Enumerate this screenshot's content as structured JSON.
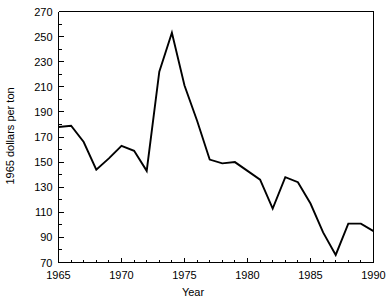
{
  "chart_data": {
    "type": "line",
    "title": "",
    "xlabel": "Year",
    "ylabel": "1965 dollars per ton",
    "xlim": [
      1965,
      1990
    ],
    "ylim": [
      70,
      270
    ],
    "grid": false,
    "legend": false,
    "x_major_ticks": [
      1965,
      1970,
      1975,
      1980,
      1985,
      1990
    ],
    "x_tick_labels": [
      "1965",
      "1970",
      "1975",
      "1980",
      "1985",
      "1990"
    ],
    "x_minor_tick_step": 1,
    "y_major_ticks": [
      70,
      90,
      110,
      130,
      150,
      170,
      190,
      210,
      230,
      250,
      270
    ],
    "y_tick_labels": [
      "70",
      "90",
      "110",
      "130",
      "150",
      "170",
      "190",
      "210",
      "230",
      "250",
      "270"
    ],
    "y_minor_tick_step": 10,
    "x": [
      1965,
      1966,
      1967,
      1968,
      1969,
      1970,
      1971,
      1972,
      1973,
      1974,
      1975,
      1976,
      1977,
      1978,
      1979,
      1980,
      1981,
      1982,
      1983,
      1984,
      1985,
      1986,
      1987,
      1988,
      1989,
      1990
    ],
    "values": [
      178,
      179,
      166,
      144,
      153,
      163,
      159,
      143,
      222,
      253,
      211,
      183,
      152,
      149,
      150,
      143,
      136,
      113,
      138,
      134,
      117,
      94,
      76,
      101,
      101,
      95
    ],
    "series": [
      {
        "name": "1965 dollars per ton",
        "values": [
          178,
          179,
          166,
          144,
          153,
          163,
          159,
          143,
          222,
          253,
          211,
          183,
          152,
          149,
          150,
          143,
          136,
          113,
          138,
          134,
          117,
          94,
          76,
          101,
          101,
          95
        ]
      }
    ]
  },
  "labels": {
    "x_axis_title": "Year",
    "y_axis_title": "1965 dollars per ton"
  },
  "colors": {
    "line": "#000000",
    "axis": "#000000",
    "background": "#ffffff"
  }
}
